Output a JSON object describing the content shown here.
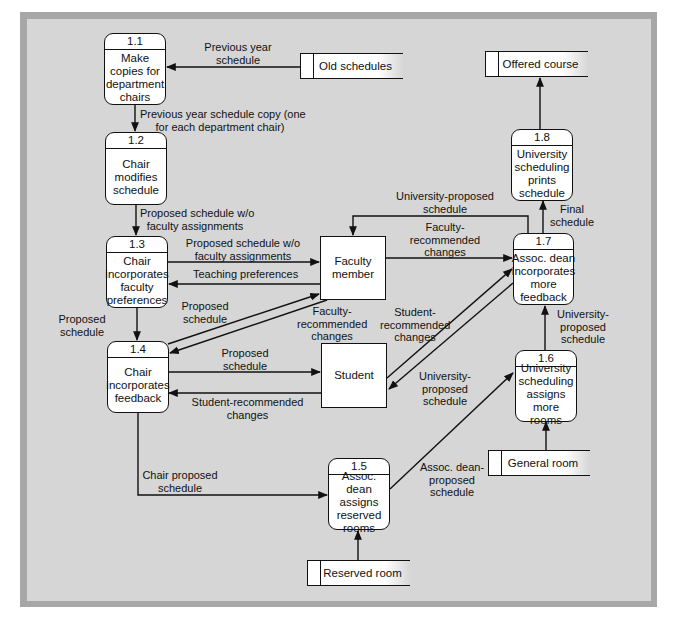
{
  "processes": [
    {
      "id": "1.1",
      "label": "Make copies for department chairs"
    },
    {
      "id": "1.2",
      "label": "Chair modifies schedule"
    },
    {
      "id": "1.3",
      "label": "Chair incorporates faculty preferences"
    },
    {
      "id": "1.4",
      "label": "Chair incorporates feedback"
    },
    {
      "id": "1.5",
      "label": "Assoc. dean assigns reserved rooms"
    },
    {
      "id": "1.6",
      "label": "University scheduling assigns more rooms"
    },
    {
      "id": "1.7",
      "label": "Assoc. dean incorporates more feedback"
    },
    {
      "id": "1.8",
      "label": "University scheduling prints schedule"
    }
  ],
  "entities": [
    {
      "label": "Faculty member"
    },
    {
      "label": "Student"
    }
  ],
  "stores": [
    {
      "label": "Old schedules"
    },
    {
      "label": "Offered course"
    },
    {
      "label": "General room"
    },
    {
      "label": "Reserved room"
    }
  ],
  "flows": [
    {
      "from": "Old schedules",
      "to": "1.1",
      "label": "Previous year schedule"
    },
    {
      "from": "1.1",
      "to": "1.2",
      "label": "Previous year schedule copy (one for each department chair)"
    },
    {
      "from": "1.2",
      "to": "1.3",
      "label": "Proposed schedule w/o faculty assignments"
    },
    {
      "from": "1.3",
      "to": "Faculty member",
      "label": "Proposed schedule w/o faculty assignments"
    },
    {
      "from": "Faculty member",
      "to": "1.3",
      "label": "Teaching preferences"
    },
    {
      "from": "1.3",
      "to": "1.4",
      "label": "Proposed schedule"
    },
    {
      "from": "1.4",
      "to": "Faculty member",
      "label": "Proposed schedule"
    },
    {
      "from": "Faculty member",
      "to": "1.4",
      "label": "Faculty-recommended changes"
    },
    {
      "from": "1.4",
      "to": "Student",
      "label": "Proposed schedule"
    },
    {
      "from": "Student",
      "to": "1.4",
      "label": "Student-recommended changes"
    },
    {
      "from": "1.4",
      "to": "1.5",
      "label": "Chair proposed schedule"
    },
    {
      "from": "Reserved room",
      "to": "1.5",
      "label": ""
    },
    {
      "from": "1.5",
      "to": "1.6",
      "label": "Assoc. dean-proposed schedule"
    },
    {
      "from": "General room",
      "to": "1.6",
      "label": ""
    },
    {
      "from": "1.6",
      "to": "1.7",
      "label": "University-proposed schedule"
    },
    {
      "from": "Faculty member",
      "to": "1.7",
      "label": "Faculty-recommended changes"
    },
    {
      "from": "Student",
      "to": "1.7",
      "label": "Student-recommended changes"
    },
    {
      "from": "1.7",
      "to": "Student",
      "label": "University-proposed schedule"
    },
    {
      "from": "1.7",
      "to": "Faculty member",
      "label": "University-proposed schedule"
    },
    {
      "from": "1.7",
      "to": "1.8",
      "label": "Final schedule"
    },
    {
      "from": "1.8",
      "to": "Offered course",
      "label": ""
    }
  ],
  "labels": {
    "prev_year_1": "Previous year",
    "prev_year_2": "schedule",
    "copy_1": "Previous year schedule copy (one",
    "copy_2": "for each department chair)",
    "wo_1_a": "Proposed schedule w/o",
    "wo_1_b": "faculty assignments",
    "wo_2_a": "Proposed schedule w/o",
    "wo_2_b": "faculty assignments",
    "teaching": "Teaching preferences",
    "prop_13_14_a": "Proposed",
    "prop_13_14_b": "schedule",
    "prop_14_fac_a": "Proposed",
    "prop_14_fac_b": "schedule",
    "frc_14_a": "Faculty-",
    "frc_14_b": "recommended",
    "frc_14_c": "changes",
    "prop_14_stu_a": "Proposed",
    "prop_14_stu_b": "schedule",
    "src_14_a": "Student-recommended",
    "src_14_b": "changes",
    "chair_prop_a": "Chair proposed",
    "chair_prop_b": "schedule",
    "adean_a": "Assoc. dean-",
    "adean_b": "proposed",
    "adean_c": "schedule",
    "ups_16_a": "University-",
    "ups_16_b": "proposed",
    "ups_16_c": "schedule",
    "frc_17_a": "Faculty-",
    "frc_17_b": "recommended",
    "frc_17_c": "changes",
    "src_17_a": "Student-",
    "src_17_b": "recommended",
    "src_17_c": "changes",
    "ups_stu_a": "University-",
    "ups_stu_b": "proposed",
    "ups_stu_c": "schedule",
    "ups_fac_a": "University-proposed",
    "ups_fac_b": "schedule",
    "final_a": "Final",
    "final_b": "schedule"
  },
  "colors": {
    "frame": "#a7a7a7",
    "canvas": "#d6d6d6",
    "line": "#111111",
    "box": "#ffffff"
  }
}
